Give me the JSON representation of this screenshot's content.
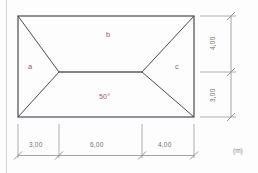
{
  "drawing": {
    "title": "hip-roof-plan",
    "unit_note": "(m)",
    "angle_label": "50°",
    "faces": [
      {
        "id": "a",
        "label": "a"
      },
      {
        "id": "b",
        "label": "b"
      },
      {
        "id": "c",
        "label": "c"
      }
    ],
    "dimensions_bottom": [
      {
        "label": "3,00"
      },
      {
        "label": "6,00"
      },
      {
        "label": "4,00"
      }
    ],
    "dimensions_right": [
      {
        "label": "4,00"
      },
      {
        "label": "3,00"
      }
    ],
    "colors": {
      "outline": "#4a4a52",
      "ridge": "#5a5a62",
      "dimension": "#9a9a9a",
      "label_text": "#9c5a63",
      "dimension_text": "#707070",
      "unit_text": "#8a8a8a",
      "background": "#fdfdfd",
      "margin_rule": "#cccccc"
    },
    "geometry": {
      "rect": {
        "left": 18,
        "top": 16,
        "right": 194,
        "bottom": 117
      },
      "ridge": {
        "x1": 59,
        "x2": 142,
        "y": 72
      }
    }
  }
}
